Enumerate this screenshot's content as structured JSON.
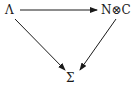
{
  "diagram": {
    "type": "commutative-triangle",
    "nodes": [
      {
        "id": "lambda",
        "label": "Λ"
      },
      {
        "id": "tensor",
        "label": "N⊗C"
      },
      {
        "id": "sigma",
        "label": "Σ"
      }
    ],
    "edges": [
      {
        "from": "lambda",
        "to": "tensor"
      },
      {
        "from": "lambda",
        "to": "sigma"
      },
      {
        "from": "tensor",
        "to": "sigma"
      }
    ],
    "colors": {
      "ink": "#1a1a1a",
      "background": "#ffffff"
    }
  }
}
